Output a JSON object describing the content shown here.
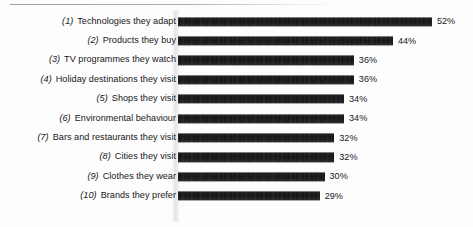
{
  "chart_data": {
    "type": "bar",
    "orientation": "horizontal",
    "title": "",
    "subtitle": "",
    "xlabel": "",
    "ylabel": "",
    "xlim": [
      0,
      52
    ],
    "grid": false,
    "legend": null,
    "value_suffix": "%",
    "categories": [
      "Technologies they adapt",
      "Products they buy",
      "TV programmes they watch",
      "Holiday destinations they visit",
      "Shops they visit",
      "Environmental behaviour",
      "Bars and restaurants they visit",
      "Cities they visit",
      "Clothes they wear",
      "Brands they prefer"
    ],
    "rank_labels": [
      "(1)",
      "(2)",
      "(3)",
      "(4)",
      "(5)",
      "(6)",
      "(7)",
      "(8)",
      "(9)",
      "(10)"
    ],
    "values": [
      52,
      44,
      36,
      36,
      34,
      34,
      32,
      32,
      30,
      29
    ],
    "value_labels": [
      "52%",
      "44%",
      "36%",
      "36%",
      "34%",
      "34%",
      "32%",
      "32%",
      "30%",
      "29%"
    ],
    "colors": {
      "bar": "#141416",
      "text": "#16161a",
      "background": "#fdfdfd",
      "rule": "#78787a"
    }
  }
}
